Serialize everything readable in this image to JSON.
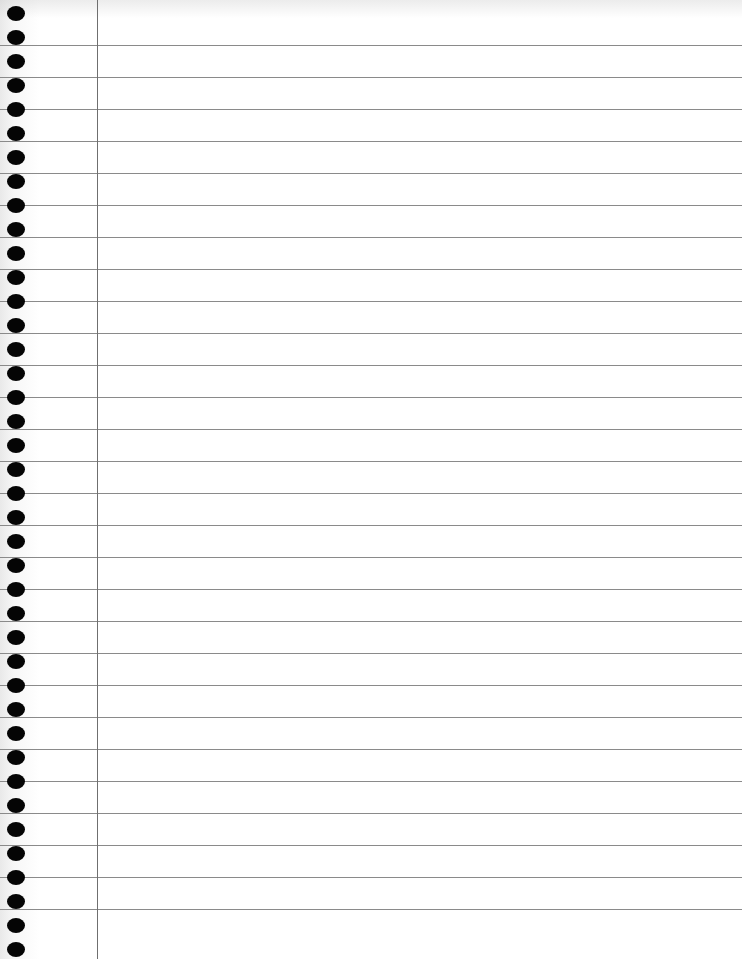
{
  "page": {
    "type": "blank lined notebook paper",
    "background_color": "#ffffff",
    "rule_color": "#8a8a8a",
    "margin_line_color": "#6f6f6f",
    "hole_color": "#050505",
    "rule_first_y": 45,
    "rule_spacing": 32,
    "rule_count": 28,
    "hole_first_y": 6,
    "hole_spacing": 24,
    "hole_count": 40,
    "margin_x": 97
  }
}
